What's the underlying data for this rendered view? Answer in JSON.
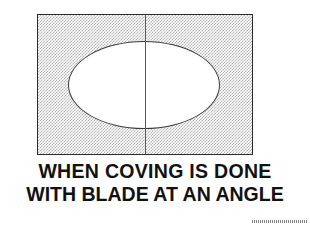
{
  "figure": {
    "name": "coving-blade-angle-diagram",
    "background_color": "#ffffff"
  },
  "diagram": {
    "panel": {
      "label": "hatched-stock-area",
      "fill_description": "fine halftone checkerboard shading",
      "fill_color": "#b9b9b9",
      "border_color": "#2b2b2b"
    },
    "ellipse": {
      "label": "elliptical cove cut",
      "fill_color": "#ffffff",
      "border_color": "#3a3a3a"
    },
    "center_line": {
      "label": "blade centre line",
      "color": "#5c5c5c"
    }
  },
  "caption": {
    "line1": "WHEN COVING IS DONE",
    "line2": "WITH BLADE AT AN ANGLE",
    "color": "#111111"
  },
  "artifact": {
    "mark": "dashed scan artifact",
    "color": "#6b6b6b"
  }
}
